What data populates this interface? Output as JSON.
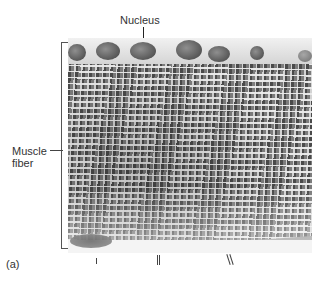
{
  "figure": {
    "panel_label": "(a)",
    "labels": {
      "nucleus": "Nucleus",
      "muscle_fiber_line1": "Muscle",
      "muscle_fiber_line2": "fiber"
    },
    "colors": {
      "background": "#ffffff",
      "label_text": "#333333",
      "tissue_dark": "#4a4a4a",
      "tissue_light": "#e8e8e8"
    }
  }
}
